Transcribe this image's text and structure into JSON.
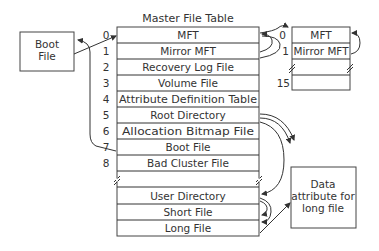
{
  "diagram": {
    "title": "Master File Table",
    "mft_rows": [
      {
        "index": "0",
        "label": "MFT"
      },
      {
        "index": "1",
        "label": "Mirror MFT"
      },
      {
        "index": "2",
        "label": "Recovery Log File"
      },
      {
        "index": "3",
        "label": "Volume File"
      },
      {
        "index": "4",
        "label": "Attribute Definition Table"
      },
      {
        "index": "5",
        "label": "Root Directory"
      },
      {
        "index": "6",
        "label": "Allocation Bitmap File"
      },
      {
        "index": "7",
        "label": "Boot File"
      },
      {
        "index": "8",
        "label": "Bad Cluster File"
      },
      {
        "index": "",
        "label": ""
      },
      {
        "index": "",
        "label": "User Directory"
      },
      {
        "index": "",
        "label": "Short File"
      },
      {
        "index": "",
        "label": "Long File"
      }
    ],
    "mirror_rows": [
      {
        "index": "0",
        "label": "MFT"
      },
      {
        "index": "1",
        "label": "Mirror MFT"
      },
      {
        "index": "",
        "label": ""
      },
      {
        "index": "15",
        "label": ""
      }
    ],
    "boot_box": {
      "line1": "Boot",
      "line2": "File"
    },
    "data_box": {
      "line1": "Data",
      "line2": "attribute for",
      "line3": "long file"
    }
  }
}
